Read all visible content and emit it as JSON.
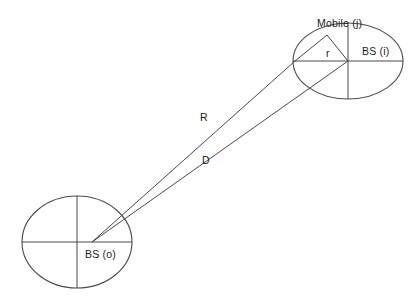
{
  "diagram": {
    "type": "geometric-schematic",
    "canvas": {
      "width": 415,
      "height": 297,
      "background": "#ffffff"
    },
    "stroke_color": "#4a4a4a",
    "text_color": "#1c1c1c",
    "labels": {
      "mobile_j": "Mobile (j)",
      "bs_i": "BS (i)",
      "bs_o": "BS (o)",
      "radius_r": "r",
      "distance_R": "R",
      "distance_D": "D"
    },
    "cells": [
      {
        "name": "serving-cell-o",
        "label": "BS (o)",
        "center": {
          "x": 77,
          "y": 242
        },
        "radius_x": 55,
        "radius_y": 46,
        "crosshair": true
      },
      {
        "name": "interfering-cell-i",
        "label": "BS (i)",
        "center": {
          "x": 348,
          "y": 61
        },
        "radius_x": 55,
        "radius_y": 38,
        "crosshair": true
      }
    ],
    "points": [
      {
        "name": "mobile-j",
        "x": 327,
        "y": 35
      },
      {
        "name": "cell-i-left-edge",
        "x": 295,
        "y": 61
      },
      {
        "name": "bs-o-center",
        "x": 92,
        "y": 242
      },
      {
        "name": "bs-i-center",
        "x": 348,
        "y": 61
      }
    ],
    "segments": [
      {
        "name": "distance-R",
        "label": "R",
        "from": "bs-o-center",
        "to": "cell-i-left-edge"
      },
      {
        "name": "distance-D",
        "label": "D",
        "from": "bs-o-center",
        "to": "bs-i-center"
      },
      {
        "name": "radius-r-to-mobile",
        "label": "r",
        "from": "bs-i-center",
        "to": "mobile-j"
      },
      {
        "name": "chord-mobile-to-edge",
        "label": "",
        "from": "mobile-j",
        "to": "cell-i-left-edge"
      }
    ]
  }
}
